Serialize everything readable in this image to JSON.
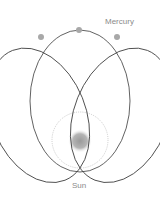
{
  "labels": {
    "planet": "Mercury",
    "star": "Sun"
  },
  "colors": {
    "orbit": "#3a3a3a",
    "planet_dot": "#a8a8a8",
    "sun_halo": "#bdbdbd",
    "sun_core": "#9a9a9a",
    "label": "#8a8a8a"
  },
  "orbits": [
    {
      "name": "orbit-left",
      "cx": 65,
      "cy": 105,
      "rx": 51,
      "ry": 68,
      "rotate": -18
    },
    {
      "name": "orbit-center",
      "cx": 80,
      "cy": 101,
      "rx": 50,
      "ry": 71,
      "rotate": 0
    },
    {
      "name": "orbit-right",
      "cx": 95,
      "cy": 105,
      "rx": 51,
      "ry": 68,
      "rotate": 18
    }
  ],
  "planet_positions": [
    {
      "x": 41,
      "y": 37
    },
    {
      "x": 79,
      "y": 30
    },
    {
      "x": 117,
      "y": 37
    }
  ]
}
